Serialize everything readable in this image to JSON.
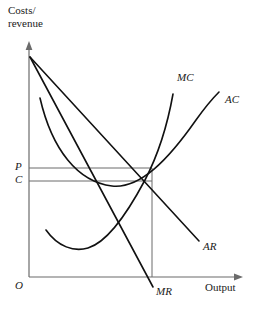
{
  "diagram": {
    "type": "economics-cost-revenue-diagram",
    "title": "",
    "axes": {
      "y_label_line1": "Costs/",
      "y_label_line2": "revenue",
      "x_label": "Output",
      "origin_label": "O",
      "axis_color": "#6b6b6b",
      "curve_color": "#111111"
    },
    "value_markers": [
      {
        "name": "price",
        "label": "P",
        "y": 168
      },
      {
        "name": "cost",
        "label": "C",
        "y": 181
      }
    ],
    "curves": [
      {
        "name": "marginal-cost",
        "label": "MC",
        "label_x": 177,
        "label_y": 78
      },
      {
        "name": "average-cost",
        "label": "AC",
        "label_x": 225,
        "label_y": 100
      },
      {
        "name": "average-revenue",
        "label": "AR",
        "label_x": 203,
        "label_y": 247
      },
      {
        "name": "marginal-revenue",
        "label": "MR",
        "label_x": 156,
        "label_y": 292
      }
    ],
    "geometry": {
      "origin_x": 29,
      "origin_y": 277,
      "y_axis_top": 42,
      "x_axis_right": 243,
      "revenue_intercept_y": 57,
      "equilibrium_x": 152,
      "equilibrium_y": 183,
      "mr_x_intercept": 145
    }
  }
}
